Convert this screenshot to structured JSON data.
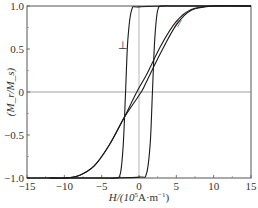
{
  "chart_data": {
    "type": "line",
    "title": "",
    "xlabel": "H/(10^5 A·m^-1)",
    "ylabel": "(M_r/M_s)",
    "xlim": [
      -15,
      15
    ],
    "ylim": [
      -1.0,
      1.0
    ],
    "x_ticks": [
      -15,
      -10,
      -5,
      0,
      5,
      10,
      15
    ],
    "y_ticks": [
      -1.0,
      -0.5,
      0,
      0.5,
      1.0
    ],
    "x_tick_labels": [
      "−15",
      "−10",
      "−5",
      "0",
      "5",
      "10",
      "15"
    ],
    "y_tick_labels": [
      "−1.0",
      "−0.5",
      "0",
      "0.5",
      "1.0"
    ],
    "grid": false,
    "reference_lines": {
      "horizontal_y": 0,
      "vertical_x": 0
    },
    "annotations": [
      {
        "text": "⊥",
        "x": -2.1,
        "y": 0.5
      },
      {
        "text": "//",
        "x": 5.2,
        "y": 0.76
      }
    ],
    "series": [
      {
        "name": "⊥ descending branch",
        "x": [
          15,
          5,
          0,
          -1,
          -1.5,
          -1.8,
          -2.1,
          -2.5,
          -3.2,
          -5,
          -15
        ],
        "y": [
          1.0,
          1.0,
          0.99,
          0.95,
          0.6,
          0.0,
          -0.6,
          -0.95,
          -1.0,
          -1.0,
          -1.0
        ]
      },
      {
        "name": "⊥ ascending branch",
        "x": [
          -15,
          -5,
          0,
          1,
          1.5,
          1.8,
          2.1,
          2.5,
          3.2,
          5,
          15
        ],
        "y": [
          -1.0,
          -1.0,
          -0.99,
          -0.95,
          -0.6,
          0.0,
          0.6,
          0.95,
          1.0,
          1.0,
          1.0
        ]
      },
      {
        "name": "// descending branch",
        "x": [
          15,
          10,
          7,
          5,
          3,
          1,
          -0.3,
          -2,
          -4,
          -6,
          -8,
          -10,
          -12
        ],
        "y": [
          1.0,
          1.0,
          0.96,
          0.82,
          0.55,
          0.2,
          0.0,
          -0.3,
          -0.62,
          -0.86,
          -0.97,
          -1.0,
          -1.0
        ]
      },
      {
        "name": "// ascending branch",
        "x": [
          -12,
          -10,
          -8,
          -6,
          -4,
          -2,
          0.3,
          1,
          3,
          5,
          7,
          10,
          15
        ],
        "y": [
          -1.0,
          -1.0,
          -0.97,
          -0.86,
          -0.62,
          -0.3,
          0.0,
          0.12,
          0.47,
          0.78,
          0.95,
          1.0,
          1.0
        ]
      }
    ]
  },
  "labels": {
    "y_axis": "(M_r/M_s)",
    "x_axis_prefix": "H/(10",
    "x_axis_sup": "5",
    "x_axis_suffix": "A·m",
    "x_axis_sup2": "−1",
    "x_axis_close": ")",
    "perp_marker": "⊥",
    "parallel_marker": "//"
  }
}
